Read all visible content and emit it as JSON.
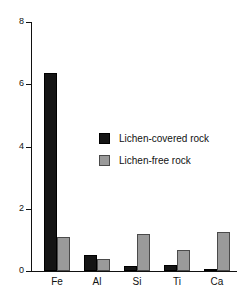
{
  "chart_data": {
    "type": "bar",
    "title": "",
    "subtitle": "",
    "xlabel": "",
    "ylabel": "",
    "categories": [
      "Fe",
      "Al",
      "Si",
      "Ti",
      "Ca"
    ],
    "series": [
      {
        "name": "Lichen-covered rock",
        "color": "#151515",
        "values": [
          6.35,
          0.52,
          0.15,
          0.2,
          0.05
        ]
      },
      {
        "name": "Lichen-free rock",
        "color": "#9a9a9a",
        "values": [
          1.1,
          0.4,
          1.2,
          0.68,
          1.25
        ]
      }
    ],
    "ylim": [
      0,
      8
    ],
    "yticks": [
      0,
      2,
      4,
      6,
      8
    ],
    "ytick_labels": [
      "0",
      "2",
      "4",
      "6",
      "8"
    ],
    "grid": false,
    "legend_position": "center"
  },
  "legend": {
    "entries": [
      {
        "label": "Lichen-covered rock",
        "swatch": "covered"
      },
      {
        "label": "Lichen-free rock",
        "swatch": "free"
      }
    ]
  }
}
